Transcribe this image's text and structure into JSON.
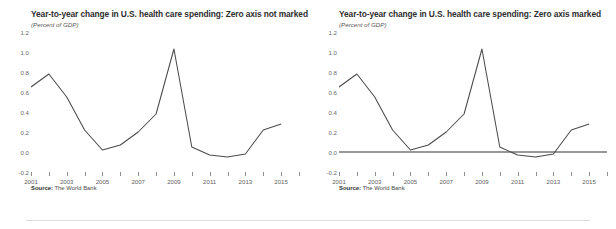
{
  "figure": {
    "source_prefix": "Source:",
    "source_text": "The World Bank",
    "line_color": "#4a4a4a",
    "zero_line_color": "#333333",
    "tick_color": "#8d8d8d"
  },
  "panels": [
    {
      "id": "zero-axis-not-marked",
      "title": "Year-to-year change in U.S. health care spending: Zero axis not marked",
      "subtitle": "(Percent of GDP)",
      "zero_line": false,
      "source_prefix": "Source:",
      "source_text": "The World Bank"
    },
    {
      "id": "zero-axis-marked",
      "title": "Year-to-year change in U.S. health care spending: Zero axis marked",
      "subtitle": "(Percent of GDP)",
      "zero_line": true,
      "source_prefix": "Source:",
      "source_text": "The World Bank"
    }
  ],
  "chart_data": [
    {
      "type": "line",
      "title": "Year-to-year change in U.S. health care spending: Zero axis not marked",
      "subtitle": "(Percent of GDP)",
      "xlabel": "",
      "ylabel": "Percent of GDP",
      "ylim": [
        -0.2,
        1.2
      ],
      "yticks": [
        -0.2,
        0.0,
        0.2,
        0.4,
        0.6,
        0.8,
        1.0,
        1.2
      ],
      "ytick_labels": [
        "-0.2",
        "0.0",
        "0.2",
        "0.4",
        "0.6",
        "0.8",
        "1.0",
        "1.2"
      ],
      "xlim": [
        2001,
        2016
      ],
      "xticks": [
        2001,
        2002,
        2003,
        2004,
        2005,
        2006,
        2007,
        2008,
        2009,
        2010,
        2011,
        2012,
        2013,
        2014,
        2015,
        2016
      ],
      "xtick_labels": [
        "2001",
        "",
        "2003",
        "",
        "2005",
        "",
        "2007",
        "",
        "2009",
        "",
        "2011",
        "",
        "2013",
        "",
        "2015",
        ""
      ],
      "grid": false,
      "legend": false,
      "zero_line_drawn": false,
      "x": [
        2001,
        2002,
        2003,
        2004,
        2005,
        2006,
        2007,
        2008,
        2009,
        2010,
        2011,
        2012,
        2013,
        2014,
        2015
      ],
      "values": [
        0.65,
        0.78,
        0.55,
        0.22,
        0.02,
        0.07,
        0.2,
        0.38,
        1.03,
        0.05,
        -0.03,
        -0.05,
        -0.02,
        0.22,
        0.28
      ],
      "annotations": [
        "Source: The World Bank"
      ]
    },
    {
      "type": "line",
      "title": "Year-to-year change in U.S. health care spending: Zero axis marked",
      "subtitle": "(Percent of GDP)",
      "xlabel": "",
      "ylabel": "Percent of GDP",
      "ylim": [
        -0.2,
        1.2
      ],
      "yticks": [
        -0.2,
        0.0,
        0.2,
        0.4,
        0.6,
        0.8,
        1.0,
        1.2
      ],
      "ytick_labels": [
        "-0.2",
        "0.0",
        "0.2",
        "0.4",
        "0.6",
        "0.8",
        "1.0",
        "1.2"
      ],
      "xlim": [
        2001,
        2016
      ],
      "xticks": [
        2001,
        2002,
        2003,
        2004,
        2005,
        2006,
        2007,
        2008,
        2009,
        2010,
        2011,
        2012,
        2013,
        2014,
        2015,
        2016
      ],
      "xtick_labels": [
        "2001",
        "",
        "2003",
        "",
        "2005",
        "",
        "2007",
        "",
        "2009",
        "",
        "2011",
        "",
        "2013",
        "",
        "2015",
        ""
      ],
      "grid": false,
      "legend": false,
      "zero_line_drawn": true,
      "x": [
        2001,
        2002,
        2003,
        2004,
        2005,
        2006,
        2007,
        2008,
        2009,
        2010,
        2011,
        2012,
        2013,
        2014,
        2015
      ],
      "values": [
        0.65,
        0.78,
        0.55,
        0.22,
        0.02,
        0.07,
        0.2,
        0.38,
        1.03,
        0.05,
        -0.03,
        -0.05,
        -0.02,
        0.22,
        0.28
      ],
      "annotations": [
        "Source: The World Bank"
      ]
    }
  ]
}
